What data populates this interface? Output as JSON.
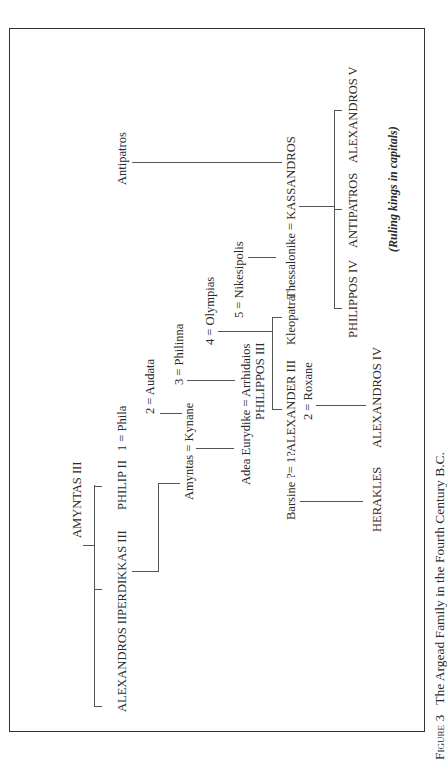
{
  "caption": {
    "label": "Figure 3",
    "title": "The Argead Family in the Fourth Century B.C."
  },
  "note": "(Ruling kings in capitals)",
  "nodes": {
    "amyntas3": "AMYNTAS III",
    "alexandros2": "ALEXANDROS II",
    "perdikkas3": "PERDIKKAS III",
    "philip2": "PHILIP II",
    "phila": "1 = Phila",
    "audata": "2 = Audata",
    "philinna": "3 = Philinna",
    "olympias": "4 = Olympias",
    "nikesipolis": "5 = Nikesipolis",
    "amyntas_kynane": "Amyntas = Kynane",
    "adea_arrhidaios": "Adea Eurydike = Arrhidaios",
    "philippos3": "PHILIPPOS III",
    "barsine": "Barsine ?= 1?",
    "alexander3": "ALEXANDER III",
    "roxane": "2 = Roxane",
    "kleopatra": "Kleopatra",
    "thessalonike_kassandros": "Thessalonike = KASSANDROS",
    "antipatros_elder": "Antipatros",
    "herakles": "HERAKLES",
    "alexandros4": "ALEXANDROS IV",
    "philippos4": "PHILIPPOS IV",
    "antipatros": "ANTIPATROS",
    "alexandros5": "ALEXANDROS V"
  },
  "diagram_data": {
    "type": "family-tree",
    "orientation": "rotated-90-ccw",
    "relations": [
      {
        "parent": "AMYNTAS III",
        "children": [
          "ALEXANDROS II",
          "PERDIKKAS III",
          "PHILIP II"
        ]
      },
      {
        "parent": "PERDIKKAS III",
        "children": [
          "Amyntas"
        ]
      },
      {
        "couple": [
          "PHILIP II",
          "Phila"
        ],
        "order": 1
      },
      {
        "couple": [
          "PHILIP II",
          "Audata"
        ],
        "order": 2,
        "children": [
          "Kynane"
        ]
      },
      {
        "couple": [
          "PHILIP II",
          "Philinna"
        ],
        "order": 3,
        "children": [
          "Arrhidaios (PHILIPPOS III)"
        ]
      },
      {
        "couple": [
          "PHILIP II",
          "Olympias"
        ],
        "order": 4,
        "children": [
          "ALEXANDER III",
          "Kleopatra"
        ]
      },
      {
        "couple": [
          "PHILIP II",
          "Nikesipolis"
        ],
        "order": 5,
        "children": [
          "Thessalonike"
        ]
      },
      {
        "couple": [
          "Amyntas",
          "Kynane"
        ],
        "children": [
          "Adea Eurydike"
        ]
      },
      {
        "couple": [
          "Adea Eurydike",
          "Arrhidaios"
        ]
      },
      {
        "couple": [
          "Barsine",
          "ALEXANDER III"
        ],
        "children": [
          "HERAKLES"
        ],
        "uncertain": true
      },
      {
        "couple": [
          "ALEXANDER III",
          "Roxane"
        ],
        "order": 2,
        "children": [
          "ALEXANDROS IV"
        ]
      },
      {
        "parent": "Antipatros",
        "children": [
          "KASSANDROS"
        ]
      },
      {
        "couple": [
          "Thessalonike",
          "KASSANDROS"
        ],
        "children": [
          "PHILIPPOS IV",
          "ANTIPATROS",
          "ALEXANDROS V"
        ]
      }
    ]
  }
}
